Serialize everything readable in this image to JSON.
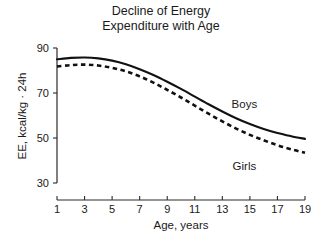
{
  "figure": {
    "title_line1": "Decline of Energy",
    "title_line2": "Expenditure with Age",
    "background_color": "#ffffff",
    "line_color": "#111111"
  },
  "chart_data": {
    "type": "line",
    "xlabel": "Age, years",
    "ylabel": "EE, kcal/kg · 24h",
    "xlim": [
      1,
      19
    ],
    "ylim": [
      30,
      90
    ],
    "xticks": [
      1,
      3,
      5,
      7,
      9,
      11,
      13,
      15,
      17,
      19
    ],
    "yticks": [
      30,
      50,
      70,
      90
    ],
    "xtick_labels": [
      "1",
      "3",
      "5",
      "7",
      "9",
      "11",
      "13",
      "15",
      "17",
      "19"
    ],
    "ytick_labels": [
      "30",
      "50",
      "70",
      "90"
    ],
    "grid": false,
    "legend": "inline-annotations",
    "x": [
      1,
      2,
      3,
      4,
      5,
      6,
      7,
      8,
      9,
      10,
      11,
      12,
      13,
      14,
      15,
      16,
      17,
      18,
      19
    ],
    "series": [
      {
        "name": "Boys",
        "style": "solid",
        "label_x": 14.6,
        "label_y": 63.5,
        "values": [
          85.0,
          85.6,
          85.8,
          85.4,
          84.4,
          82.8,
          80.6,
          78.0,
          75.0,
          71.8,
          68.4,
          65.0,
          61.8,
          58.8,
          56.2,
          54.0,
          52.2,
          50.8,
          49.6
        ]
      },
      {
        "name": "Girls",
        "style": "dashed",
        "label_x": 14.6,
        "label_y": 36.0,
        "values": [
          81.8,
          82.4,
          82.6,
          82.2,
          81.2,
          79.6,
          77.4,
          74.6,
          71.4,
          68.0,
          64.4,
          60.8,
          57.4,
          54.2,
          51.4,
          49.0,
          46.8,
          45.0,
          43.4
        ]
      }
    ]
  }
}
